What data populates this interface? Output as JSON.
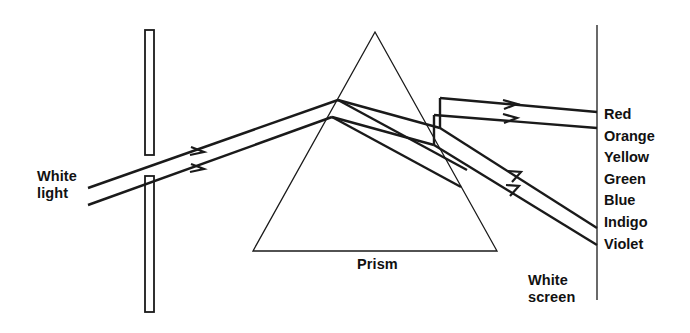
{
  "diagram": {
    "stroke_color": "#1a1a1a",
    "background_color": "#ffffff",
    "labels": {
      "white_light": "White\nlight",
      "prism": "Prism",
      "white_screen": "White\nscreen"
    },
    "spectrum": {
      "colors": [
        "Red",
        "Orange",
        "Yellow",
        "Green",
        "Blue",
        "Indigo",
        "Violet"
      ]
    },
    "components": {
      "slit_barrier": "slit-barrier",
      "prism": "prism-triangle",
      "screen": "white-screen-line",
      "incoming_beam": "white-light-beam",
      "red_beam": "red-exit-beam",
      "violet_beam": "violet-exit-beam"
    },
    "geometry": {
      "barrier_x": 145,
      "barrier_width": 9,
      "barrier_top_y": 30,
      "barrier_gap_top_y": 155,
      "barrier_gap_bottom_y": 176,
      "barrier_bottom_y": 312,
      "prism_apex": [
        375,
        32
      ],
      "prism_base_left": [
        253,
        251
      ],
      "prism_base_right": [
        497,
        251
      ],
      "screen_x": 597,
      "screen_top_y": 25,
      "screen_bottom_y": 300
    }
  }
}
